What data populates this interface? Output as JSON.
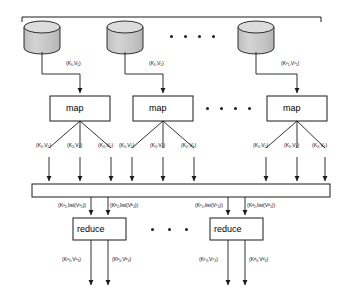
{
  "diagram": {
    "colors": {
      "line": "#1b1b1b",
      "cylinder_fill": "#c9c9c9",
      "cylinder_top": "#d8d8d8",
      "box_fill": "#ffffff",
      "background": "#ffffff"
    },
    "input_sources": [
      {
        "name": "input-split-1"
      },
      {
        "name": "input-split-2"
      },
      {
        "name": "input-split-n"
      }
    ],
    "input_labels": [
      {
        "text": "(K₁,V₁)"
      },
      {
        "text": "(K₁,V₁)"
      },
      {
        "text": "(Kⁿ₁,Vⁿ₁)"
      }
    ],
    "map_boxes": [
      {
        "label": "map"
      },
      {
        "label": "map"
      },
      {
        "label": "map"
      }
    ],
    "map_ellipsis": "• • • •",
    "top_ellipsis": "• • • •",
    "reduce_ellipsis": "• • •",
    "intermediate_labels": [
      {
        "text": "(K₂,V₂)"
      },
      {
        "text": "(K₂,V₂)"
      },
      {
        "text": "(K₂,V₂)"
      },
      {
        "text": "(K₂,V₂)"
      },
      {
        "text": "(K₂,V₂)"
      },
      {
        "text": "(K₂,V₂)"
      },
      {
        "text": "(K₂,V₂)"
      },
      {
        "text": "(K₂,V₂)"
      },
      {
        "text": "(K₂,V₂)"
      }
    ],
    "shuffle_bar": {
      "name": "shuffle-and-sort-bar",
      "label": ""
    },
    "grouped_labels": [
      {
        "text": "(Kᵃ₂,list(Vᵃ₂))"
      },
      {
        "text": "(Kᵇ₂,list(Vᵇ₂))"
      },
      {
        "text": "(Kᶜ₂,list(Vᶜ₂))"
      },
      {
        "text": "(Kᵈ₂,list(Vᵈ₂))"
      }
    ],
    "reduce_boxes": [
      {
        "label": "reduce"
      },
      {
        "label": "reduce"
      }
    ],
    "output_labels": [
      {
        "text": "(Kᵃ₃,Vᵃ₃)"
      },
      {
        "text": "(Kᵇ₃,Vᵇ₃)"
      },
      {
        "text": "(Kᶜ₃,Vᶜ₃)"
      },
      {
        "text": "(Kᵈ₃,Vᵈ₃)"
      }
    ]
  }
}
